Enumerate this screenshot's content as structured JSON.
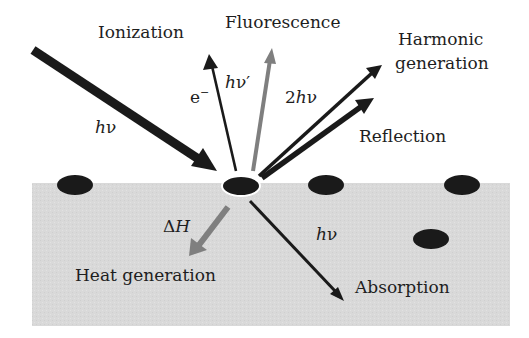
{
  "diagram": {
    "colors": {
      "background": "#ffffff",
      "substrate": "#d9d9d9",
      "particle": "#1a1a1a",
      "arrow_dark": "#1a1a1a",
      "arrow_gray": "#7f7f7f",
      "text": "#1e1e1e"
    },
    "labels": {
      "ionization": "Ionization",
      "fluorescence": "Fluorescence",
      "harmonic_line1": "Harmonic",
      "harmonic_line2": "generation",
      "reflection": "Reflection",
      "heat_generation": "Heat generation",
      "absorption": "Absorption"
    },
    "symbols": {
      "incident_h": "h",
      "incident_nu": "ν",
      "electron_e": "e",
      "electron_sup": "−",
      "fluor_h": "h",
      "fluor_nu": "ν′",
      "harmonic_2": "2",
      "harmonic_h": "h",
      "harmonic_nu": "ν",
      "delta": "Δ",
      "enthalpy_H": "H",
      "absorb_h": "h",
      "absorb_nu": "ν"
    },
    "nodes": [
      {
        "name": "central-particle",
        "cx": 241,
        "cy": 186
      },
      {
        "name": "particle-1",
        "cx": 75,
        "cy": 185
      },
      {
        "name": "particle-2",
        "cx": 326,
        "cy": 185
      },
      {
        "name": "particle-3",
        "cx": 462,
        "cy": 185
      },
      {
        "name": "particle-4",
        "cx": 431,
        "cy": 239
      }
    ],
    "arrows": [
      {
        "name": "incident-photon",
        "from": "outside",
        "to": "central-particle",
        "label": "hν"
      },
      {
        "name": "ionization-electron",
        "from": "central-particle",
        "to": "outside",
        "label": "e−"
      },
      {
        "name": "fluorescence-photon",
        "from": "central-particle",
        "to": "outside",
        "label": "hν′"
      },
      {
        "name": "harmonic-photon",
        "from": "central-particle",
        "to": "outside",
        "label": "2hν"
      },
      {
        "name": "reflected-photon",
        "from": "central-particle",
        "to": "outside",
        "label": ""
      },
      {
        "name": "heat-flow",
        "from": "central-particle",
        "to": "substrate",
        "label": "ΔH"
      },
      {
        "name": "absorbed-photon",
        "from": "central-particle",
        "to": "substrate",
        "label": "hν"
      }
    ]
  }
}
